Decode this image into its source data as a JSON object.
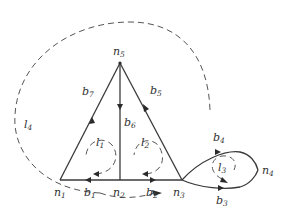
{
  "diagram": {
    "type": "graph",
    "colors": {
      "edge": "#3a3a3a",
      "loop": "#555555",
      "background": "#ffffff"
    },
    "nodes": [
      {
        "id": "n1",
        "label": "n",
        "sub": "1"
      },
      {
        "id": "n2",
        "label": "n",
        "sub": "2"
      },
      {
        "id": "n3",
        "label": "n",
        "sub": "3"
      },
      {
        "id": "n4",
        "label": "n",
        "sub": "4"
      },
      {
        "id": "n5",
        "label": "n",
        "sub": "5"
      }
    ],
    "branches": [
      {
        "id": "b1",
        "label": "b",
        "sub": "1",
        "from": "n2",
        "to": "n1"
      },
      {
        "id": "b2",
        "label": "b",
        "sub": "2",
        "from": "n2",
        "to": "n3"
      },
      {
        "id": "b3",
        "label": "b",
        "sub": "3",
        "from": "n3",
        "to": "n4"
      },
      {
        "id": "b4",
        "label": "b",
        "sub": "4",
        "from": "n3",
        "to": "n4"
      },
      {
        "id": "b5",
        "label": "b",
        "sub": "5",
        "from": "n3",
        "to": "n5"
      },
      {
        "id": "b6",
        "label": "b",
        "sub": "6",
        "from": "n5",
        "to": "n2"
      },
      {
        "id": "b7",
        "label": "b",
        "sub": "7",
        "from": "n1",
        "to": "n5"
      }
    ],
    "loops": [
      {
        "id": "l1",
        "label": "l",
        "sub": "1",
        "direction": "clockwise"
      },
      {
        "id": "l2",
        "label": "l",
        "sub": "2",
        "direction": "clockwise"
      },
      {
        "id": "l3",
        "label": "l",
        "sub": "3",
        "direction": "counterclockwise"
      },
      {
        "id": "l4",
        "label": "l",
        "sub": "4",
        "direction": "clockwise"
      }
    ]
  }
}
